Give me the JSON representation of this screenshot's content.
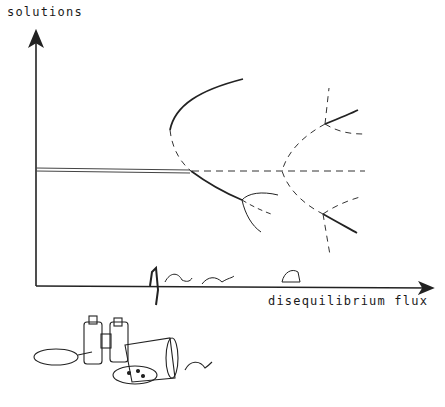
{
  "diagram": {
    "type": "bifurcation-diagram",
    "style": "hand-drawn illustration",
    "y_axis_label": "solutions",
    "x_axis_label": "disequilibrium flux",
    "line_legend": {
      "solid": "stable branch",
      "dashed": "unstable branch"
    },
    "bifurcation_points": 4,
    "decorations": [
      "caterpillars on x-axis",
      "binoculars",
      "magnifying glass",
      "tipped jar",
      "petri dish"
    ]
  }
}
